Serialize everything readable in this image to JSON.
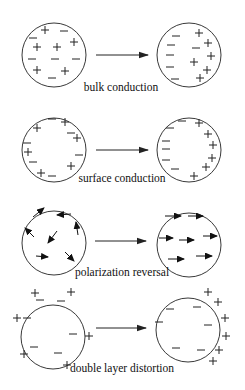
{
  "diagram": {
    "colors": {
      "stroke": "#222222",
      "text": "#111111",
      "background": "#ffffff"
    },
    "rows": [
      {
        "id": "bulk",
        "label": "bulk conduction",
        "label_pos": [
          121,
          91
        ],
        "arrow": {
          "x1": 96,
          "x2": 148,
          "y": 55
        },
        "left": {
          "cx": 54,
          "cy": 55,
          "r": 32,
          "plus": [
            [
              45,
              30
            ],
            [
              37,
              47
            ],
            [
              57,
              47
            ],
            [
              74,
              42
            ],
            [
              37,
              70
            ],
            [
              65,
              71
            ]
          ],
          "minus": [
            [
              64,
              31
            ],
            [
              33,
              38
            ],
            [
              32,
              59
            ],
            [
              55,
              59
            ],
            [
              76,
              59
            ],
            [
              52,
              78
            ]
          ]
        },
        "right": {
          "cx": 189,
          "cy": 55,
          "r": 32,
          "plus": [
            [
              199,
              33
            ],
            [
              208,
              43
            ],
            [
              211,
              56
            ],
            [
              194,
              62
            ],
            [
              207,
              70
            ],
            [
              200,
              78
            ]
          ],
          "minus": [
            [
              176,
              36
            ],
            [
              171,
              45
            ],
            [
              196,
              48
            ],
            [
              170,
              55
            ],
            [
              170,
              67
            ],
            [
              175,
              79
            ]
          ]
        }
      },
      {
        "id": "surface",
        "label": "surface conduction",
        "label_pos": [
          122,
          182
        ],
        "arrow": {
          "x1": 96,
          "x2": 148,
          "y": 150
        },
        "left": {
          "cx": 54,
          "cy": 150,
          "r": 32,
          "plus": [
            [
              37,
              128
            ],
            [
              65,
              122
            ],
            [
              77,
              138
            ],
            [
              28,
              152
            ],
            [
              71,
              166
            ],
            [
              41,
              173
            ]
          ],
          "minus": [
            [
              52,
              119
            ],
            [
              71,
              133
            ],
            [
              27,
              143
            ],
            [
              79,
              155
            ],
            [
              33,
              162
            ],
            [
              52,
              176
            ]
          ]
        },
        "right": {
          "cx": 189,
          "cy": 150,
          "r": 32,
          "plus": [
            [
              199,
              123
            ],
            [
              208,
              134
            ],
            [
              213,
              145
            ],
            [
              212,
              158
            ],
            [
              206,
              167
            ],
            [
              194,
              176
            ]
          ],
          "minus": [
            [
              182,
              121
            ],
            [
              170,
              128
            ],
            [
              166,
              141
            ],
            [
              166,
              149
            ],
            [
              166,
              160
            ],
            [
              175,
              169
            ]
          ]
        }
      },
      {
        "id": "polarization",
        "label": "polarization reversal",
        "label_pos": [
          122,
          276
        ],
        "arrow": {
          "x1": 95,
          "x2": 146,
          "y": 241
        },
        "left": {
          "cx": 54,
          "cy": 243,
          "r": 32,
          "arrows": [
            {
              "x1": 33,
              "y1": 217,
              "x2": 44,
              "y2": 208
            },
            {
              "x1": 71,
              "y1": 214,
              "x2": 57,
              "y2": 215
            },
            {
              "x1": 78,
              "y1": 235,
              "x2": 76,
              "y2": 222
            },
            {
              "x1": 34,
              "y1": 237,
              "x2": 25,
              "y2": 228
            },
            {
              "x1": 57,
              "y1": 231,
              "x2": 48,
              "y2": 243
            },
            {
              "x1": 36,
              "y1": 256,
              "x2": 48,
              "y2": 257
            },
            {
              "x1": 65,
              "y1": 252,
              "x2": 74,
              "y2": 261
            }
          ]
        },
        "right": {
          "cx": 189,
          "cy": 245,
          "r": 32,
          "arrows": [
            {
              "x1": 165,
              "y1": 216,
              "x2": 181,
              "y2": 216
            },
            {
              "x1": 188,
              "y1": 216,
              "x2": 203,
              "y2": 216
            },
            {
              "x1": 159,
              "y1": 238,
              "x2": 173,
              "y2": 238
            },
            {
              "x1": 179,
              "y1": 240,
              "x2": 194,
              "y2": 240
            },
            {
              "x1": 203,
              "y1": 236,
              "x2": 217,
              "y2": 236
            },
            {
              "x1": 168,
              "y1": 259,
              "x2": 184,
              "y2": 259
            },
            {
              "x1": 196,
              "y1": 256,
              "x2": 212,
              "y2": 256
            }
          ]
        }
      },
      {
        "id": "double-layer",
        "label": "double layer distortion",
        "label_pos": [
          122,
          372
        ],
        "arrow": {
          "x1": 96,
          "x2": 146,
          "y": 328
        },
        "left": {
          "cx": 53,
          "cy": 337,
          "r": 32,
          "plus": [
            [
              35,
              293
            ],
            [
              71,
              292
            ],
            [
              17,
              318
            ],
            [
              89,
              336
            ],
            [
              24,
              354
            ],
            [
              67,
              365
            ]
          ],
          "minus": [
            [
              40,
              300
            ],
            [
              61,
              301
            ],
            [
              27,
              318
            ],
            [
              73,
              334
            ],
            [
              34,
              347
            ],
            [
              58,
              353
            ]
          ]
        },
        "right": {
          "cx": 188,
          "cy": 330,
          "r": 32,
          "plus": [
            [
              208,
              292
            ],
            [
              218,
              302
            ],
            [
              225,
              318
            ],
            [
              226,
              336
            ],
            [
              219,
              350
            ],
            [
              213,
              361
            ]
          ],
          "minus": [
            [
              170,
              309
            ],
            [
              197,
              307
            ],
            [
              159,
              322
            ],
            [
              208,
              325
            ],
            [
              176,
              348
            ],
            [
              201,
              350
            ]
          ]
        }
      }
    ]
  }
}
